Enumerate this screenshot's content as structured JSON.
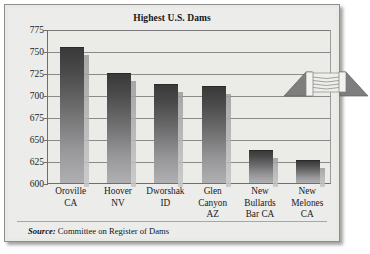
{
  "chart_data": {
    "type": "bar",
    "title": "Highest U.S. Dams",
    "xlabel": "",
    "ylabel": "",
    "ylim": [
      600,
      775
    ],
    "ytick_step": 25,
    "yticks": [
      775,
      750,
      725,
      700,
      675,
      650,
      625,
      600
    ],
    "grid": true,
    "legend": "none",
    "categories": [
      "Oroville CA",
      "Hoover NV",
      "Dworshak ID",
      "Glen Canyon AZ",
      "New Bullards Bar CA",
      "New Melones CA"
    ],
    "category_lines": [
      [
        "Oroville",
        "CA"
      ],
      [
        "Hoover",
        "NV"
      ],
      [
        "Dworshak",
        "ID"
      ],
      [
        "Glen",
        "Canyon",
        "AZ"
      ],
      [
        "New",
        "Bullards",
        "Bar CA"
      ],
      [
        "New",
        "Melones",
        "CA"
      ]
    ],
    "values": [
      754,
      725,
      713,
      710,
      638,
      626
    ],
    "source": {
      "label": "Source:",
      "text": "Committee on Register of Dams"
    }
  },
  "colors": {
    "figure_background": "#e9e9e6",
    "plot_background": "#ebebe8",
    "bar_top": "#39393a",
    "bar_bottom": "#b0b0b2",
    "gridline": "#8a8a8a",
    "axis": "#6e6e6e",
    "text": "#18191c",
    "logo_wing": "#7d7d7d",
    "logo_spillway": "#e4e4e0"
  },
  "decoration": {
    "logo_name": "dam-illustration"
  }
}
